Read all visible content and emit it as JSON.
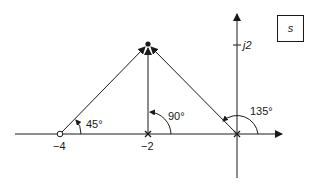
{
  "diagram": {
    "type": "s-plane pole-zero angle diagram",
    "plane_label": "s",
    "axes": {
      "real_axis": {
        "arrow": "right"
      },
      "imag_axis": {
        "arrow": "up",
        "tick_label": "j2"
      }
    },
    "points": [
      {
        "kind": "zero",
        "symbol": "open-circle",
        "real": -4,
        "imag": 0,
        "label": "−4"
      },
      {
        "kind": "pole",
        "symbol": "x",
        "real": -2,
        "imag": 0,
        "label": "−2"
      },
      {
        "kind": "pole",
        "symbol": "x",
        "real": 0,
        "imag": 0,
        "label": ""
      },
      {
        "kind": "test-point",
        "symbol": "filled-dot",
        "real": -2,
        "imag": 2,
        "label": ""
      }
    ],
    "angles": [
      {
        "from": "−4",
        "value": "45°"
      },
      {
        "from": "−2",
        "value": "90°"
      },
      {
        "from": "0",
        "value": "135°"
      }
    ],
    "colors": {
      "ink": "#1a1a1a",
      "background": "#ffffff"
    }
  }
}
